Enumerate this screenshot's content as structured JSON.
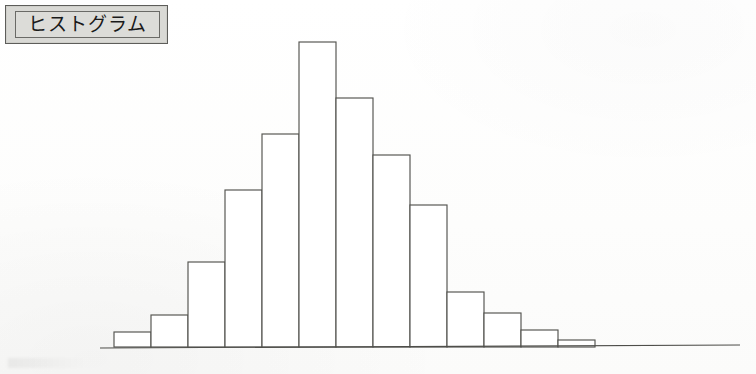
{
  "page": {
    "background_color": "#fefefe",
    "width": 756,
    "height": 374
  },
  "title_box": {
    "label": "ヒストグラム",
    "background_color": "#d9d9d5",
    "border_color": "#5d5d5a"
  },
  "chart_data": {
    "type": "bar",
    "title": "ヒストグラム",
    "xlabel": "",
    "ylabel": "",
    "grid": false,
    "legend": null,
    "axis": {
      "baseline_y": 347,
      "baseline_x_start": 100,
      "baseline_x_end": 740,
      "x_tick_labels": [],
      "y_tick_labels": []
    },
    "bar_geometry": {
      "first_bar_left_x": 114,
      "bar_width": 37,
      "stroke_color": "#53534f",
      "fill_color": "#ffffff"
    },
    "categories": [
      "1",
      "2",
      "3",
      "4",
      "5",
      "6",
      "7",
      "8",
      "9",
      "10",
      "11",
      "12",
      "13",
      "14"
    ],
    "values": [
      15,
      32,
      85,
      157,
      213,
      305,
      249,
      192,
      142,
      55,
      34,
      17,
      7,
      0
    ],
    "ylim": [
      0,
      310
    ]
  }
}
